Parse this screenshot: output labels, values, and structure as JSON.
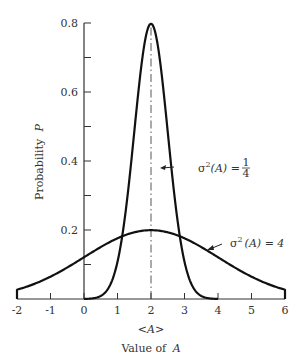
{
  "chart_data": {
    "type": "line",
    "title": "",
    "xlabel": "Value of A",
    "ylabel": "Probability P",
    "xlim": [
      -2,
      6
    ],
    "ylim": [
      0,
      0.8
    ],
    "x_ticks": [
      "-2",
      "-1",
      "0",
      "1",
      "2",
      "3",
      "4",
      "5",
      "6"
    ],
    "y_ticks": [
      "0.2",
      "0.4",
      "0.6",
      "0.8"
    ],
    "mean_marker_label": "<A>",
    "mean_value": 2,
    "grid": false,
    "legend_position": "inline annotations",
    "series": [
      {
        "name": "σ²(A) = 1/4",
        "variance": 0.25,
        "x": [
          0,
          0.5,
          1,
          1.25,
          1.5,
          1.75,
          2,
          2.25,
          2.5,
          2.75,
          3,
          3.5,
          4
        ],
        "values": [
          0.0003,
          0.008,
          0.108,
          0.241,
          0.484,
          0.704,
          0.798,
          0.704,
          0.484,
          0.241,
          0.108,
          0.008,
          0.0003
        ]
      },
      {
        "name": "σ²(A) = 4",
        "variance": 4,
        "x": [
          -2,
          -1,
          0,
          1,
          2,
          3,
          4,
          5,
          6
        ],
        "values": [
          0.027,
          0.065,
          0.121,
          0.176,
          0.199,
          0.176,
          0.121,
          0.065,
          0.027
        ]
      }
    ],
    "annotations": [
      {
        "text": "σ²(A) = 1/4",
        "points_to": "narrow curve"
      },
      {
        "text": "σ²(A) = 4",
        "points_to": "wide curve"
      }
    ]
  },
  "labels": {
    "y_axis": "Probability",
    "y_axis_var": "P",
    "x_axis": "Value of",
    "x_axis_var": "A",
    "mean": "<A>",
    "ann_narrow_prefix": "σ",
    "ann_narrow_sup": "2",
    "ann_narrow_mid": "(A) =",
    "ann_narrow_num": "1",
    "ann_narrow_den": "4",
    "ann_wide_prefix": "σ",
    "ann_wide_sup": "2",
    "ann_wide_mid": "(A) = 4"
  }
}
